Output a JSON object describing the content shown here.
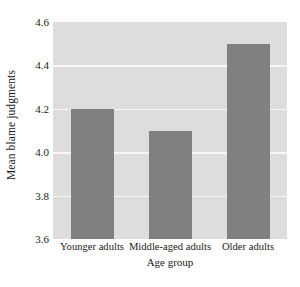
{
  "chart_data": {
    "type": "bar",
    "title": "",
    "subtitle": "",
    "categories": [
      "Younger adults",
      "Middle-aged adults",
      "Older adults"
    ],
    "values": [
      4.2,
      4.1,
      4.5
    ],
    "xlabel": "Age group",
    "ylabel": "Mean blame judgments",
    "ylim": [
      3.6,
      4.6
    ],
    "ytick_labels": [
      "4.6",
      "4.4",
      "4.2",
      "4.0",
      "3.8",
      "3.6"
    ],
    "ytick_values": [
      4.6,
      4.4,
      4.2,
      4.0,
      3.8,
      3.6
    ],
    "grid": true,
    "grid_color": "#f7f7f7",
    "legend": null,
    "legend_position": "none",
    "bar_color": "#808080",
    "plot_background_color": "#dddddd",
    "figure_background_color": "#ffffff",
    "annotations": []
  }
}
